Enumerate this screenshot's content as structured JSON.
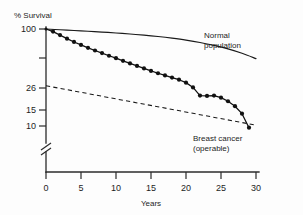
{
  "chart_data": {
    "type": "line",
    "title": "",
    "xlabel": "Years",
    "ylabel": "% Survival",
    "xlim": [
      0,
      30
    ],
    "ylim": [
      0,
      100
    ],
    "grid": false,
    "legend_position": "inline-annotation",
    "x_ticks": [
      "0",
      "5",
      "10",
      "15",
      "20",
      "25",
      "30"
    ],
    "x_tick_values": [
      0,
      5,
      10,
      15,
      20,
      25,
      30
    ],
    "y_ticks": [
      "100",
      "26",
      "15",
      "10"
    ],
    "y_tick_values": [
      100,
      26,
      15,
      10
    ],
    "y_axis_break": true,
    "y_axis_break_note": "broken axis below 10",
    "annotations": [
      {
        "name": "normal-population",
        "line1": "Normal",
        "line2": "population"
      },
      {
        "name": "breast-cancer",
        "line1": "Breast cancer",
        "line2": "(operable)"
      }
    ],
    "series": [
      {
        "name": "Normal population",
        "style": "solid",
        "markers": false,
        "x": [
          0,
          2,
          4,
          6,
          8,
          10,
          12,
          14,
          16,
          18,
          20,
          22,
          24,
          26,
          28,
          30
        ],
        "values": [
          100,
          98.2,
          96.5,
          94.8,
          93.0,
          91.0,
          88.8,
          86.4,
          83.6,
          80.4,
          76.8,
          72.6,
          67.8,
          62.4,
          56.2,
          49.5
        ]
      },
      {
        "name": "Breast cancer (operable)",
        "style": "solid-with-dots",
        "markers": true,
        "x": [
          0,
          1,
          2,
          3,
          4,
          5,
          6,
          7,
          8,
          9,
          10,
          11,
          12,
          13,
          14,
          15,
          16,
          17,
          18,
          19,
          20,
          21,
          22,
          23,
          24,
          25,
          26,
          27,
          28,
          29
        ],
        "values": [
          100,
          94.0,
          86.5,
          79.5,
          73.5,
          68.5,
          64.0,
          60.0,
          56.5,
          53.0,
          50.0,
          47.0,
          44.2,
          41.6,
          39.2,
          37.0,
          35.0,
          33.2,
          31.6,
          30.0,
          28.0,
          25.0,
          20.6,
          20.4,
          20.6,
          19.6,
          18.0,
          16.0,
          13.4,
          9.6
        ]
      },
      {
        "name": "Expected baseline",
        "style": "dashed",
        "markers": false,
        "x": [
          0,
          30
        ],
        "values": [
          26,
          10.2
        ]
      }
    ]
  }
}
